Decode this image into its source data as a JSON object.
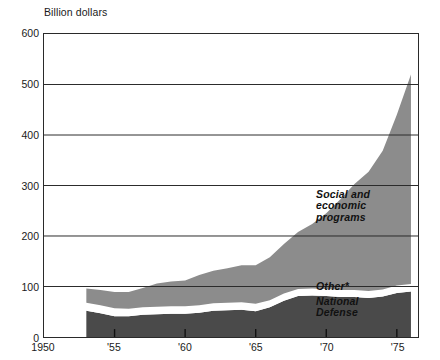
{
  "chart_data": {
    "type": "area",
    "stacked": true,
    "title": "",
    "xlabel": "",
    "ylabel": "Billion dollars",
    "ylim": [
      0,
      600
    ],
    "xlim": [
      1950,
      1976.5
    ],
    "grid": true,
    "legend_position": "inline-band-labels",
    "y_ticks": [
      "600",
      "500",
      "400",
      "300",
      "200",
      "100",
      "0"
    ],
    "y_tick_values": [
      600,
      500,
      400,
      300,
      200,
      100,
      0
    ],
    "x_ticks": [
      "1950",
      "'55",
      "'60",
      "'65",
      "'70",
      "'75"
    ],
    "x_tick_values": [
      1950,
      1955,
      1960,
      1965,
      1970,
      1975
    ],
    "x": [
      1953,
      1954,
      1955,
      1956,
      1957,
      1958,
      1959,
      1960,
      1961,
      1962,
      1963,
      1964,
      1965,
      1966,
      1967,
      1968,
      1969,
      1970,
      1971,
      1972,
      1973,
      1974,
      1975,
      1976
    ],
    "series": [
      {
        "name": "National Defense",
        "color": "#4a4a4a",
        "values": [
          52,
          47,
          41,
          41,
          44,
          45,
          46,
          46,
          48,
          52,
          53,
          54,
          51,
          59,
          72,
          81,
          82,
          81,
          79,
          79,
          77,
          80,
          87,
          90
        ]
      },
      {
        "name": "Other*",
        "color": "#ffffff",
        "values": [
          16,
          16,
          16,
          15,
          15,
          15,
          15,
          15,
          15,
          15,
          15,
          15,
          15,
          14,
          14,
          14,
          14,
          14,
          14,
          14,
          14,
          14,
          15,
          15
        ]
      },
      {
        "name": "Social and economic programs",
        "color": "#8c8c8c",
        "values": [
          28,
          30,
          32,
          33,
          38,
          46,
          49,
          51,
          60,
          64,
          68,
          73,
          76,
          85,
          98,
          113,
          128,
          150,
          180,
          210,
          236,
          275,
          338,
          415
        ]
      }
    ],
    "annotations": [
      {
        "name": "social-and-economic-programs",
        "text": "Social and\neconomic\nprograms"
      },
      {
        "name": "other",
        "text": "Other*"
      },
      {
        "name": "national-defense",
        "text": "National\nDefense"
      }
    ],
    "colors": {
      "defense": "#4a4a4a",
      "other": "#ffffff",
      "social": "#8c8c8c",
      "axis": "#2a2a2a",
      "grid": "#2a2a2a",
      "text": "#1a1a1a"
    }
  }
}
